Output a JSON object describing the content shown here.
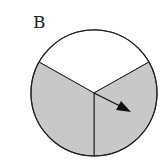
{
  "diagram": {
    "label": "B",
    "type": "spinner",
    "sections": [
      {
        "name": "top",
        "fill": "#ffffff"
      },
      {
        "name": "lower-left",
        "fill": "#c8c8c8"
      },
      {
        "name": "lower-right",
        "fill": "#c8c8c8"
      }
    ],
    "colors": {
      "stroke": "#222222",
      "shaded": "#c8c8c8",
      "white": "#ffffff"
    }
  }
}
